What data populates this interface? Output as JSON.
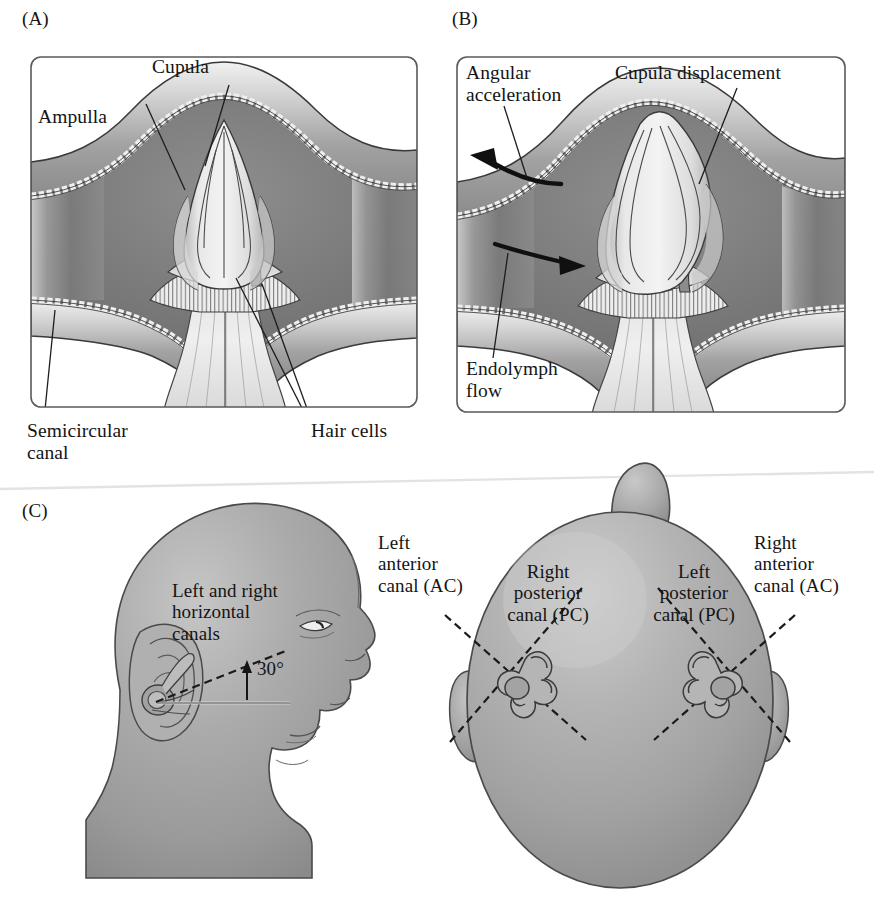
{
  "figure": {
    "title_visible": false,
    "panels": [
      {
        "tag": "(A)"
      },
      {
        "tag": "(B)"
      },
      {
        "tag": "(C)"
      }
    ]
  },
  "panel_a": {
    "tag": "(A)",
    "labels": {
      "cupula": "Cupula",
      "ampulla": "Ampulla",
      "semicircular_canal": "Semicircular\ncanal",
      "hair_cells": "Hair cells"
    }
  },
  "panel_b": {
    "tag": "(B)",
    "labels": {
      "angular_acceleration": "Angular\nacceleration",
      "cupula_displacement": "Cupula displacement",
      "endolymph_flow": "Endolymph\nflow"
    }
  },
  "panel_c": {
    "tag": "(C)",
    "labels": {
      "horizontal_canals": "Left and right\nhorizontal\ncanals",
      "angle": "30°",
      "left_anterior": "Left\nanterior\ncanal (AC)",
      "right_posterior": "Right\nposterior\ncanal (PC)",
      "left_posterior": "Left\nposterior\ncanal (PC)",
      "right_anterior": "Right\nanterior\ncanal (AC)"
    }
  },
  "colors": {
    "ink": "#141414",
    "frame": "#3d3d3d",
    "page": "#ffffff",
    "tissue_dark": "#7d7d7d",
    "tissue_mid": "#9a9a9a",
    "tissue_light": "#c9c9c9",
    "cupula": "#dcdcdc",
    "head_fill": "#a9a9a9",
    "head_shade": "#8c8c8c"
  }
}
